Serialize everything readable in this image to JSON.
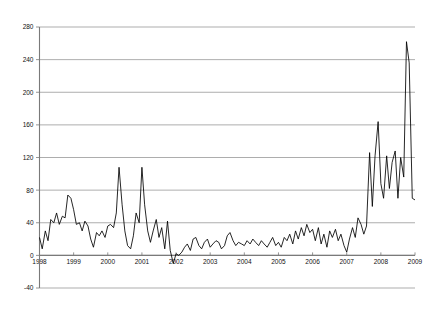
{
  "chart_data": {
    "type": "line",
    "title": "",
    "subtitle": "",
    "xlabel": "",
    "ylabel": "",
    "grid": "horizontal",
    "legend": "none",
    "ylim": [
      -40,
      280
    ],
    "yticks": [
      -40,
      0,
      40,
      80,
      120,
      160,
      200,
      240,
      280
    ],
    "ytick_labels": [
      "-40",
      "0",
      "40",
      "80",
      "120",
      "160",
      "200",
      "240",
      "280"
    ],
    "xlim": [
      1998.0,
      2009.0
    ],
    "xticks": [
      1998,
      1999,
      2000,
      2001,
      2002,
      2003,
      2004,
      2005,
      2006,
      2007,
      2008,
      2009
    ],
    "xtick_labels": [
      "1998",
      "1999",
      "2000",
      "2001",
      "2002",
      "2003",
      "2004",
      "2005",
      "2006",
      "2007",
      "2008",
      "2009"
    ],
    "series": [
      {
        "name": "series-1",
        "color": "#000000",
        "x": [
          1998.0,
          1998.08,
          1998.17,
          1998.25,
          1998.33,
          1998.42,
          1998.5,
          1998.58,
          1998.67,
          1998.75,
          1998.83,
          1998.92,
          1999.0,
          1999.08,
          1999.17,
          1999.25,
          1999.33,
          1999.42,
          1999.5,
          1999.58,
          1999.67,
          1999.75,
          1999.83,
          1999.92,
          2000.0,
          2000.08,
          2000.17,
          2000.25,
          2000.33,
          2000.42,
          2000.5,
          2000.58,
          2000.67,
          2000.75,
          2000.83,
          2000.92,
          2001.0,
          2001.08,
          2001.17,
          2001.25,
          2001.33,
          2001.42,
          2001.5,
          2001.58,
          2001.67,
          2001.75,
          2001.83,
          2001.92,
          2002.0,
          2002.08,
          2002.17,
          2002.25,
          2002.33,
          2002.42,
          2002.5,
          2002.58,
          2002.67,
          2002.75,
          2002.83,
          2002.92,
          2003.0,
          2003.08,
          2003.17,
          2003.25,
          2003.33,
          2003.42,
          2003.5,
          2003.58,
          2003.67,
          2003.75,
          2003.83,
          2003.92,
          2004.0,
          2004.08,
          2004.17,
          2004.25,
          2004.33,
          2004.42,
          2004.5,
          2004.58,
          2004.67,
          2004.75,
          2004.83,
          2004.92,
          2005.0,
          2005.08,
          2005.17,
          2005.25,
          2005.33,
          2005.42,
          2005.5,
          2005.58,
          2005.67,
          2005.75,
          2005.83,
          2005.92,
          2006.0,
          2006.08,
          2006.17,
          2006.25,
          2006.33,
          2006.42,
          2006.5,
          2006.58,
          2006.67,
          2006.75,
          2006.83,
          2006.92,
          2007.0,
          2007.08,
          2007.17,
          2007.25,
          2007.33,
          2007.42,
          2007.5,
          2007.58,
          2007.67,
          2007.75,
          2007.83,
          2007.92,
          2008.0,
          2008.08,
          2008.17,
          2008.25,
          2008.33,
          2008.42,
          2008.5,
          2008.58,
          2008.67,
          2008.75,
          2008.83,
          2008.92,
          2009.0
        ],
        "values": [
          22,
          8,
          30,
          18,
          44,
          40,
          52,
          38,
          48,
          46,
          74,
          70,
          56,
          38,
          40,
          30,
          42,
          36,
          20,
          10,
          28,
          24,
          30,
          22,
          36,
          38,
          34,
          52,
          108,
          62,
          30,
          12,
          8,
          24,
          52,
          40,
          108,
          62,
          30,
          16,
          30,
          44,
          22,
          34,
          8,
          42,
          6,
          -10,
          2,
          0,
          4,
          10,
          14,
          6,
          20,
          22,
          12,
          8,
          16,
          20,
          10,
          14,
          18,
          16,
          8,
          12,
          24,
          28,
          18,
          12,
          16,
          14,
          12,
          18,
          14,
          20,
          16,
          12,
          18,
          14,
          10,
          16,
          22,
          12,
          16,
          10,
          22,
          18,
          26,
          14,
          30,
          20,
          34,
          24,
          38,
          28,
          32,
          18,
          34,
          14,
          26,
          10,
          30,
          22,
          32,
          18,
          26,
          12,
          4,
          20,
          34,
          22,
          46,
          38,
          26,
          36,
          126,
          60,
          122,
          164,
          88,
          70,
          122,
          82,
          114,
          128,
          70,
          120,
          96,
          262,
          236,
          70,
          68
        ]
      }
    ]
  },
  "axes": {
    "y_axis_name": "value-axis",
    "x_axis_name": "year-axis"
  }
}
